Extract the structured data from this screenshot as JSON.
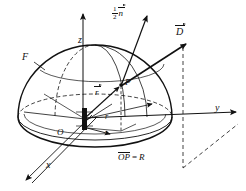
{
  "figure": {
    "type": "technical-line-diagram",
    "background_color": "#ffffff",
    "stroke_color": "#111111"
  },
  "axes": {
    "z": {
      "label": "z",
      "direction": "up",
      "arrow": true
    },
    "y": {
      "label": "y",
      "direction": "right",
      "arrow": true
    },
    "x": {
      "label": "x",
      "direction": "down-left",
      "arrow": true
    }
  },
  "labels": {
    "surface": "F",
    "origin": "O",
    "point": "P",
    "radius_scalar": "r",
    "source_element": "s"
  },
  "vectors": {
    "displacement": {
      "symbol": "D",
      "accent": "arrow"
    },
    "position": {
      "symbol": "r",
      "accent": "arrow"
    },
    "normal": {
      "coefficient_numerator": "1",
      "coefficient_denominator": "2",
      "symbol": "n",
      "accent": "arrow"
    }
  },
  "caption": {
    "segment": "OP",
    "equals": "=",
    "value": "R"
  }
}
